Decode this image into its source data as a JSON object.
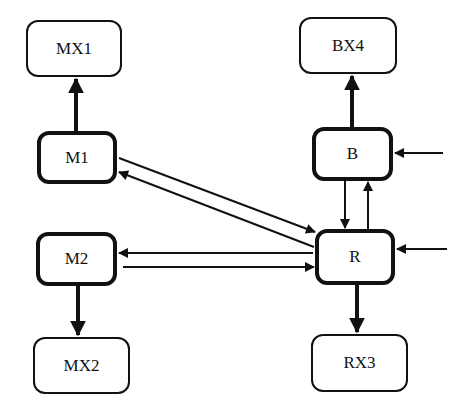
{
  "diagram": {
    "nodes": [
      {
        "id": "MX1",
        "label": "MX1",
        "x": 26,
        "y": 20,
        "w": 96,
        "h": 57,
        "bold": false
      },
      {
        "id": "M1",
        "label": "M1",
        "x": 37,
        "y": 131,
        "w": 80,
        "h": 53,
        "bold": true
      },
      {
        "id": "M2",
        "label": "M2",
        "x": 36,
        "y": 232,
        "w": 81,
        "h": 54,
        "bold": true
      },
      {
        "id": "MX2",
        "label": "MX2",
        "x": 33,
        "y": 337,
        "w": 97,
        "h": 57,
        "bold": false
      },
      {
        "id": "BX4",
        "label": "BX4",
        "x": 299,
        "y": 17,
        "w": 98,
        "h": 57,
        "bold": false
      },
      {
        "id": "B",
        "label": "B",
        "x": 312,
        "y": 127,
        "w": 81,
        "h": 54,
        "bold": true
      },
      {
        "id": "R",
        "label": "R",
        "x": 315,
        "y": 229,
        "w": 80,
        "h": 56,
        "bold": true
      },
      {
        "id": "RX3",
        "label": "RX3",
        "x": 311,
        "y": 334,
        "w": 97,
        "h": 58,
        "bold": false
      }
    ],
    "edges": [
      {
        "from": "M1",
        "to": "MX1",
        "style": "thick"
      },
      {
        "from": "M2",
        "to": "MX2",
        "style": "thick"
      },
      {
        "from": "B",
        "to": "BX4",
        "style": "thick"
      },
      {
        "from": "R",
        "to": "RX3",
        "style": "thick"
      },
      {
        "from": "M1",
        "to": "R",
        "style": "thin"
      },
      {
        "from": "R",
        "to": "M1",
        "style": "thin"
      },
      {
        "from": "R",
        "to": "M2",
        "style": "thin"
      },
      {
        "from": "M2",
        "to": "R",
        "style": "thin"
      },
      {
        "from": "B",
        "to": "R",
        "style": "thin"
      },
      {
        "from": "R",
        "to": "B",
        "style": "thin"
      },
      {
        "from": "external",
        "to": "B",
        "style": "thin"
      },
      {
        "from": "external",
        "to": "R",
        "style": "thin"
      }
    ]
  }
}
